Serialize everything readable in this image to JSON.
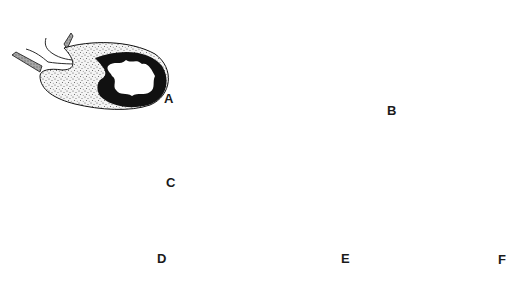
{
  "figure": {
    "type": "multi-panel line drawing",
    "panel_count": 6,
    "colors": {
      "background": "#ffffff",
      "ink": "#111111",
      "stipple": "#444444",
      "stipple_fill": "#f1f1f1",
      "shaded_band": "#9a9a9a"
    },
    "panels": [
      {
        "id": "A",
        "label": "A",
        "description": "oval sac with thick black irregular wall lining, stippled outer region, two ducts entering from upper left"
      },
      {
        "id": "B",
        "label": "B",
        "description": "large sac, large stippled body, thin black crescent band, clear outer envelope, two shaded ducts at top left"
      },
      {
        "id": "C",
        "label": "C",
        "description": "elongated curved sac, thin black band following inner curve, stippled lower portion"
      },
      {
        "id": "D",
        "label": "D",
        "description": "hook-shaped sac, thick black curved band, clear inner lumen, stippled lower-left region"
      },
      {
        "id": "E",
        "label": "E",
        "description": "hook-shaped sac with very thick black band, stippled crescent below, duct lines from upper left"
      },
      {
        "id": "F",
        "label": "F",
        "description": "pear-shaped sac, stippled body, black crescent band, clear outer envelope, ducts at top"
      }
    ]
  }
}
